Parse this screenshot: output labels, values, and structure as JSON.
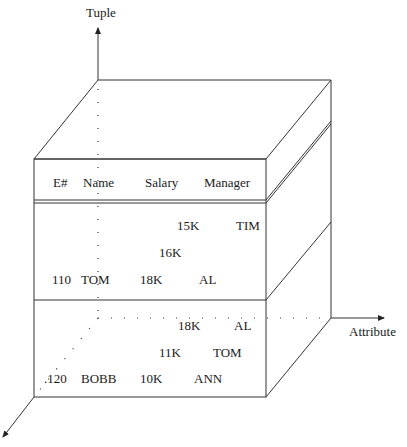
{
  "axes": {
    "tuple_label": "Tuple",
    "attribute_label": "Attribute"
  },
  "header": {
    "columns": [
      "E#",
      "Name",
      "Salary",
      "Manager"
    ]
  },
  "relation_slices": [
    {
      "rows": [
        {
          "salary": "15K",
          "manager": "TIM"
        },
        {
          "salary": "16K"
        },
        {
          "e_num": "110",
          "name": "TOM",
          "salary": "18K",
          "manager": "AL"
        }
      ]
    },
    {
      "rows": [
        {
          "salary": "18K",
          "manager": "AL"
        },
        {
          "salary": "11K",
          "manager": "TOM"
        },
        {
          "e_num": ".120",
          "name": "BOBB",
          "salary": "10K",
          "manager": "ANN"
        }
      ]
    }
  ],
  "colors": {
    "line": "#333333",
    "text": "#1a1a1a",
    "background": "#ffffff"
  }
}
